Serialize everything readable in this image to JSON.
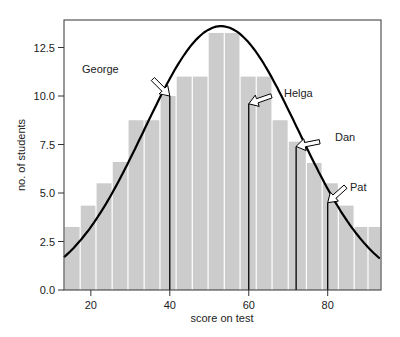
{
  "chart_data": {
    "type": "bar",
    "title": "",
    "xlabel": "score on test",
    "ylabel": "no. of students",
    "xlim": [
      13.2,
      93.5
    ],
    "ylim": [
      0,
      13.9
    ],
    "xticks": [
      20,
      40,
      60,
      80
    ],
    "yticks": [
      0.0,
      2.5,
      5.0,
      7.5,
      10.0,
      12.5
    ],
    "ytick_labels": [
      "0.0",
      "2.5",
      "5.0",
      "7.5",
      "10.0",
      "12.5"
    ],
    "xtick_labels": [
      "20",
      "40",
      "60",
      "80"
    ],
    "grid": false,
    "legend": null,
    "bar_color": "#cccccc",
    "bars": [
      {
        "x0": 13.2,
        "x1": 17.3,
        "value": 3.25
      },
      {
        "x0": 17.3,
        "x1": 21.3,
        "value": 4.35
      },
      {
        "x0": 21.3,
        "x1": 25.4,
        "value": 5.5
      },
      {
        "x0": 25.4,
        "x1": 29.4,
        "value": 6.6
      },
      {
        "x0": 29.4,
        "x1": 33.5,
        "value": 8.75
      },
      {
        "x0": 33.5,
        "x1": 37.5,
        "value": 8.75
      },
      {
        "x0": 37.5,
        "x1": 41.6,
        "value": 10.0
      },
      {
        "x0": 41.6,
        "x1": 45.7,
        "value": 11.0
      },
      {
        "x0": 45.7,
        "x1": 49.7,
        "value": 11.0
      },
      {
        "x0": 49.7,
        "x1": 53.8,
        "value": 13.25
      },
      {
        "x0": 53.8,
        "x1": 57.8,
        "value": 13.25
      },
      {
        "x0": 57.8,
        "x1": 61.9,
        "value": 11.0
      },
      {
        "x0": 61.9,
        "x1": 65.9,
        "value": 11.0
      },
      {
        "x0": 65.9,
        "x1": 70.0,
        "value": 8.75
      },
      {
        "x0": 70.0,
        "x1": 74.6,
        "value": 7.65
      },
      {
        "x0": 74.6,
        "x1": 78.6,
        "value": 6.55
      },
      {
        "x0": 78.6,
        "x1": 82.7,
        "value": 5.5
      },
      {
        "x0": 82.7,
        "x1": 86.7,
        "value": 4.35
      },
      {
        "x0": 86.7,
        "x1": 90.2,
        "value": 3.25
      },
      {
        "x0": 90.2,
        "x1": 93.5,
        "value": 3.25
      }
    ],
    "curve": {
      "type": "normal",
      "mean": 53,
      "sd": 19.5,
      "peak": 13.6,
      "color": "#000000"
    },
    "annotations": [
      {
        "label": "George",
        "score": 40,
        "value": 10.0
      },
      {
        "label": "Helga",
        "score": 60,
        "value": 9.6
      },
      {
        "label": "Dan",
        "score": 72,
        "value": 7.4
      },
      {
        "label": "Pat",
        "score": 80,
        "value": 4.5
      }
    ]
  }
}
